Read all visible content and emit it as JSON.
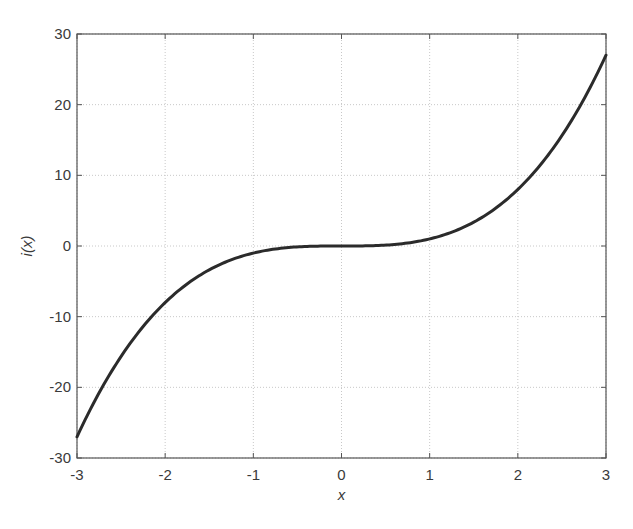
{
  "chart_data": {
    "type": "line",
    "title": "",
    "xlabel": "x",
    "ylabel": "i(x)",
    "xlim": [
      -3,
      3
    ],
    "ylim": [
      -30,
      30
    ],
    "xticks": [
      -3,
      -2,
      -1,
      0,
      1,
      2,
      3
    ],
    "yticks": [
      -30,
      -20,
      -10,
      0,
      10,
      20,
      30
    ],
    "xtick_labels": [
      "-3",
      "-2",
      "-1",
      "0",
      "1",
      "2",
      "3"
    ],
    "ytick_labels": [
      "-30",
      "-20",
      "-10",
      "0",
      "10",
      "20",
      "30"
    ],
    "grid": true,
    "legend": null,
    "series": [
      {
        "name": "i(x) = x^3",
        "color": "#2b2b2b",
        "x": [
          -3,
          -2.5,
          -2,
          -1.5,
          -1,
          -0.5,
          0,
          0.5,
          1,
          1.5,
          2,
          2.5,
          3
        ],
        "values": [
          -27,
          -15.625,
          -8,
          -3.375,
          -1,
          -0.125,
          0,
          0.125,
          1,
          3.375,
          8,
          15.625,
          27
        ]
      }
    ]
  },
  "layout": {
    "plot_left": 77,
    "plot_top": 34,
    "plot_right": 606,
    "plot_bottom": 458
  }
}
